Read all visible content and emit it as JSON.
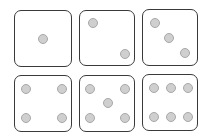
{
  "colors": {
    "background": "#ffffff",
    "die_border": "#3a3a3a",
    "pip_fill": "#cfcfcf",
    "pip_border": "#a8a8a8"
  },
  "dice": [
    {
      "value": 1,
      "label": "one"
    },
    {
      "value": 2,
      "label": "two"
    },
    {
      "value": 3,
      "label": "three"
    },
    {
      "value": 4,
      "label": "four"
    },
    {
      "value": 5,
      "label": "five"
    },
    {
      "value": 6,
      "label": "six"
    }
  ]
}
